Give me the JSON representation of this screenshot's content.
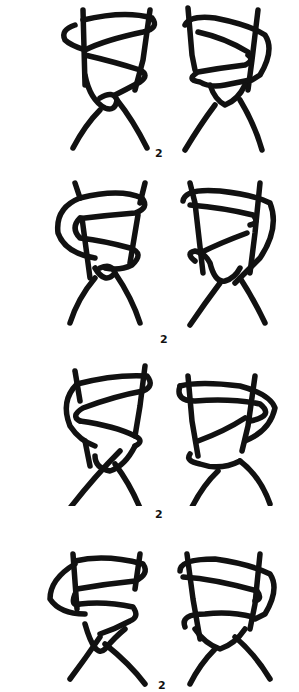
{
  "figure": {
    "type": "knot-diagram-sequence",
    "rows": [
      {
        "label": "2",
        "left": "knot-left-1",
        "right": "knot-right-1"
      },
      {
        "label": "2",
        "left": "knot-left-2",
        "right": "knot-right-2"
      },
      {
        "label": "2",
        "left": "knot-left-3",
        "right": "knot-right-3"
      },
      {
        "label": "2",
        "left": "knot-left-4",
        "right": "knot-right-4"
      }
    ],
    "colors": {
      "ink": "#111111",
      "background": "#ffffff"
    }
  }
}
